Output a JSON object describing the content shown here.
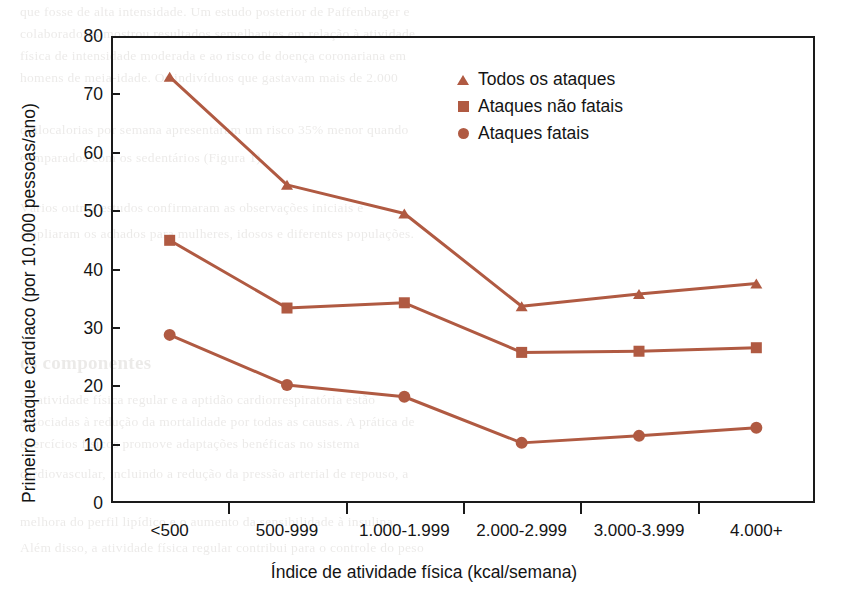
{
  "chart_data": {
    "type": "line",
    "title": "",
    "xlabel": "Índice de atividade física (kcal/semana)",
    "ylabel": "Primeiro ataque cardíaco (por 10.000 pessoas/ano)",
    "categories": [
      "<500",
      "500-999",
      "1.000-1.999",
      "2.000-2.999",
      "3.000-3.999",
      "4.000+"
    ],
    "ylim": [
      0,
      80
    ],
    "yticks": [
      0,
      10,
      20,
      30,
      40,
      50,
      60,
      70,
      80
    ],
    "grid": false,
    "legend_position": "upper right",
    "series": [
      {
        "name": "Todos os ataques",
        "marker": "triangle",
        "color": "#b05a42",
        "values": [
          73.0,
          54.5,
          49.6,
          33.7,
          35.8,
          37.6
        ]
      },
      {
        "name": "Ataques não fatais",
        "marker": "square",
        "color": "#b05a42",
        "values": [
          45.0,
          33.4,
          34.3,
          25.8,
          26.0,
          26.6
        ]
      },
      {
        "name": "Ataques fatais",
        "marker": "circle",
        "color": "#b05a42",
        "values": [
          28.8,
          20.2,
          18.2,
          10.3,
          11.5,
          12.9
        ]
      }
    ]
  },
  "axis": {
    "y_tick_labels": [
      "80",
      "70",
      "60",
      "50",
      "40",
      "30",
      "20",
      "10",
      "0"
    ],
    "y_title": "Primeiro ataque cardíaco (por 10.000 pessoas/ano)",
    "x_title": "Índice de atividade física (kcal/semana)",
    "x_tick_labels": [
      "<500",
      "500-999",
      "1.000-1.999",
      "2.000-2.999",
      "3.000-3.999",
      "4.000+"
    ]
  },
  "legend": {
    "items": [
      {
        "label": "Todos os ataques",
        "marker": "triangle-marker-icon"
      },
      {
        "label": "Ataques não fatais",
        "marker": "square-marker-icon"
      },
      {
        "label": "Ataques fatais",
        "marker": "circle-marker-icon"
      }
    ]
  },
  "colors": {
    "series": "#b05a42",
    "axis": "#1a1a1a",
    "text": "#141414",
    "background": "#ffffff"
  },
  "background_text": {
    "lines": [
      "que fosse de alta intensidade. Um estudo posterior de Paffenbarger e",
      "colaboradores mostrou resultados semelhantes em relação à atividade",
      "física de intensidade moderada e ao risco de doença coronariana em",
      "homens de meia-idade. Os indivíduos que gastavam mais de 2.000",
      "quilocalorias por semana apresentaram um risco 35% menor quando",
      "comparados com os sedentários (Figura 1).",
      "Vários outros estudos confirmaram as observações iniciais e",
      "ampliaram os achados para mulheres, idosos e diferentes populações."
    ],
    "footer_heading": "os componentes",
    "footer_lines": [
      "de atividade física regular e a aptidão cardiorrespiratória estão",
      "associadas à redução da mortalidade por todas as causas. A prática de",
      "exercícios físicos promove adaptações benéficas no sistema",
      "cardiovascular, incluindo a redução da pressão arterial de repouso, a",
      "melhora do perfil lipídico e o aumento da sensibilidade à insulina.",
      "Além disso, a atividade física regular contribui para o controle do peso"
    ]
  }
}
